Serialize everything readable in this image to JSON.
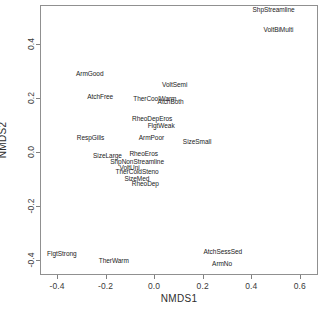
{
  "chart_data": {
    "type": "scatter",
    "title": "",
    "xlabel": "NMDS1",
    "ylabel": "NMDS2",
    "xlim": [
      -0.47,
      0.675
    ],
    "ylim": [
      -0.455,
      0.545
    ],
    "xticks": [
      "-0.4",
      "-0.2",
      "0.0",
      "0.2",
      "0.4",
      "0.6"
    ],
    "xtick_values": [
      -0.4,
      -0.2,
      0.0,
      0.2,
      0.4,
      0.6
    ],
    "yticks": [
      "0.4",
      "0.2",
      "0.0",
      "-0.2",
      "-0.4"
    ],
    "ytick_values": [
      0.4,
      0.2,
      0.0,
      -0.2,
      -0.4
    ],
    "grid": false,
    "legend": null,
    "marker": "text-label-only",
    "points": [
      {
        "label": "ShpStreamline",
        "x": 0.492,
        "y": 0.525
      },
      {
        "label": "VoltBiMulti",
        "x": 0.512,
        "y": 0.452
      },
      {
        "label": "ArmGood",
        "x": -0.265,
        "y": 0.289
      },
      {
        "label": "VoltSemi",
        "x": 0.085,
        "y": 0.249
      },
      {
        "label": "AtchFree",
        "x": -0.222,
        "y": 0.206
      },
      {
        "label": "TherCoolWarm",
        "x": 0.003,
        "y": 0.196
      },
      {
        "label": "AtchBoth",
        "x": 0.068,
        "y": 0.186
      },
      {
        "label": "RheoDepEros",
        "x": -0.008,
        "y": 0.121
      },
      {
        "label": "FlgtWeak",
        "x": 0.029,
        "y": 0.098
      },
      {
        "label": "RespGills",
        "x": -0.262,
        "y": 0.053
      },
      {
        "label": "ArmPoor",
        "x": -0.011,
        "y": 0.052
      },
      {
        "label": "SizeSmall",
        "x": 0.177,
        "y": 0.038
      },
      {
        "label": "SizeLarge",
        "x": -0.192,
        "y": -0.013
      },
      {
        "label": "RheoEros",
        "x": -0.043,
        "y": -0.007
      },
      {
        "label": "ShpNonStreamline",
        "x": -0.07,
        "y": -0.038
      },
      {
        "label": "VoltUni",
        "x": -0.101,
        "y": -0.059
      },
      {
        "label": "TherColdSteno",
        "x": -0.07,
        "y": -0.074
      },
      {
        "label": "SizeMed",
        "x": -0.071,
        "y": -0.1
      },
      {
        "label": "RheoDep",
        "x": -0.036,
        "y": -0.119
      },
      {
        "label": "FlgtStrong",
        "x": -0.38,
        "y": -0.378
      },
      {
        "label": "TherWarm",
        "x": -0.166,
        "y": -0.404
      },
      {
        "label": "AtchSessSed",
        "x": 0.283,
        "y": -0.37
      },
      {
        "label": "ArmNo",
        "x": 0.28,
        "y": -0.414
      }
    ]
  }
}
